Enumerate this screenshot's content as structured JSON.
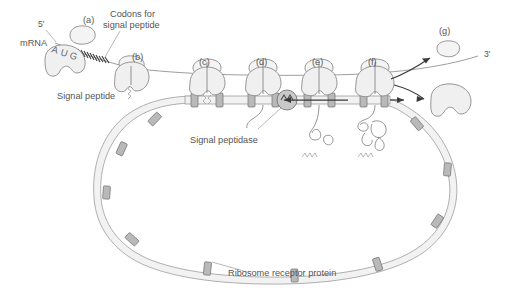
{
  "figure": {
    "background_color": "#ffffff",
    "line_color": "#8a8a8a",
    "membrane_color": "#f2f2f2",
    "receptor_color": "#b9b9b9",
    "arrow_color": "#3a3a3a"
  },
  "labels": {
    "mrna": "mRNA",
    "five_prime": "5'",
    "three_prime": "3'",
    "codon_a": "A",
    "codon_u": "U",
    "codon_g": "G",
    "codons_for_line1": "Codons for",
    "codons_for_line2": "signal peptide",
    "signal_peptide": "Signal peptide",
    "signal_peptidase": "Signal peptidase",
    "ribosome_receptor": "Ribosome receptor protein"
  },
  "stages": [
    {
      "id": "a",
      "label": "(a)",
      "x": 88,
      "y": 20,
      "description": "ribosomal subunits assemble at start codon"
    },
    {
      "id": "b",
      "label": "(b)",
      "x": 137,
      "y": 57,
      "description": "signal peptide emerges from ribosome"
    },
    {
      "id": "c",
      "label": "(c)",
      "x": 204,
      "y": 62,
      "description": "ribosome docks on ER membrane receptor"
    },
    {
      "id": "d",
      "label": "(d)",
      "x": 261,
      "y": 62,
      "description": "nascent chain threads through translocon"
    },
    {
      "id": "e",
      "label": "(e)",
      "x": 317,
      "y": 62,
      "description": "signal peptide cleaved, protein folds in lumen"
    },
    {
      "id": "f",
      "label": "(f)",
      "x": 373,
      "y": 62,
      "description": "translation terminates, protein released"
    },
    {
      "id": "g",
      "label": "(g)",
      "x": 444,
      "y": 31,
      "description": "ribosomal subunits dissociate"
    }
  ],
  "elements": {
    "membrane_name": "endoplasmic-reticulum-membrane",
    "receptor_count": 12,
    "peptidase_shape": "circle-with-zigzag",
    "free_subunits_released": 2,
    "cleaved_signal_peptides": 3
  }
}
